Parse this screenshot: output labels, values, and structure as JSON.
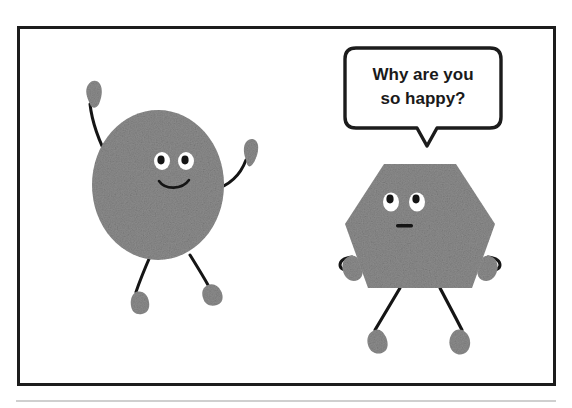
{
  "comic": {
    "title": "Two shapes cartoon",
    "panel": {
      "border_color": "#1c1c1c",
      "background_color": "#ffffff",
      "x": 17,
      "y": 26,
      "width": 538,
      "height": 359
    },
    "caption_rule": {
      "present": true,
      "color": "#c9c9c9"
    },
    "palette": {
      "shape_fill": "#8c8c8c",
      "shape_fill_dark": "#7e7e7e",
      "limb_stroke": "#151515",
      "eye_white": "#ffffff",
      "pupil": "#151515",
      "bubble_fill": "#ffffff",
      "bubble_stroke": "#1a1a1a",
      "text_color": "#1a1a1a"
    },
    "speech_bubble": {
      "speaker": "hexagon-character",
      "line1": "Why are you",
      "line2": "so happy?",
      "full_text": "Why are you so happy?",
      "tail_direction": "down"
    },
    "characters": [
      {
        "id": "circle-character",
        "shape": "circle",
        "label": "Circle",
        "expression": "smiling",
        "mouth": "smile",
        "pose": "arms-raised-celebrating",
        "eyes": 2,
        "arms": 2,
        "legs": 2
      },
      {
        "id": "hexagon-character",
        "shape": "hexagon",
        "label": "Hexagon",
        "expression": "neutral",
        "mouth": "flat",
        "pose": "arms-down-at-sides",
        "eyes": 2,
        "arms": 2,
        "legs": 2
      }
    ]
  }
}
